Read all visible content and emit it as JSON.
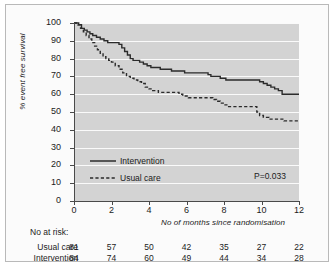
{
  "chart_data": {
    "type": "line",
    "title": "",
    "xlabel": "No of months since randomisation",
    "ylabel": "% event free survival",
    "xlim": [
      0,
      12
    ],
    "ylim": [
      0,
      100
    ],
    "xticks": [
      0,
      2,
      4,
      6,
      8,
      10,
      12
    ],
    "yticks": [
      0,
      10,
      20,
      30,
      40,
      50,
      60,
      70,
      80,
      90,
      100
    ],
    "grid": true,
    "legend_position": "center-left",
    "annotations": [
      {
        "text": "P=0.033",
        "x": 10.5,
        "y": 17
      }
    ],
    "series": [
      {
        "name": "Intervention",
        "style": "solid",
        "color": "#2b2b2b",
        "points": [
          [
            0.0,
            100
          ],
          [
            0.25,
            99
          ],
          [
            0.4,
            97
          ],
          [
            0.55,
            96
          ],
          [
            0.7,
            95
          ],
          [
            0.85,
            94
          ],
          [
            1.0,
            93
          ],
          [
            1.2,
            92
          ],
          [
            1.4,
            91
          ],
          [
            1.6,
            90
          ],
          [
            1.8,
            89
          ],
          [
            2.0,
            89
          ],
          [
            2.2,
            89
          ],
          [
            2.4,
            88
          ],
          [
            2.55,
            86
          ],
          [
            2.7,
            84
          ],
          [
            2.85,
            82
          ],
          [
            3.0,
            80
          ],
          [
            3.15,
            79
          ],
          [
            3.3,
            79
          ],
          [
            3.5,
            78
          ],
          [
            3.7,
            77
          ],
          [
            3.9,
            76
          ],
          [
            4.1,
            75
          ],
          [
            4.35,
            75
          ],
          [
            4.6,
            74
          ],
          [
            4.9,
            74
          ],
          [
            5.2,
            73
          ],
          [
            5.5,
            73
          ],
          [
            5.9,
            72
          ],
          [
            6.3,
            72
          ],
          [
            6.7,
            72
          ],
          [
            7.0,
            72
          ],
          [
            7.15,
            71
          ],
          [
            7.3,
            70
          ],
          [
            7.5,
            70
          ],
          [
            7.8,
            69
          ],
          [
            8.1,
            68
          ],
          [
            8.5,
            68
          ],
          [
            9.0,
            68
          ],
          [
            9.5,
            68
          ],
          [
            9.9,
            67
          ],
          [
            10.1,
            66
          ],
          [
            10.3,
            65
          ],
          [
            10.5,
            64
          ],
          [
            10.7,
            63
          ],
          [
            10.9,
            62
          ],
          [
            11.1,
            60
          ],
          [
            11.5,
            60
          ],
          [
            12.0,
            60
          ]
        ]
      },
      {
        "name": "Usual care",
        "style": "dashed",
        "color": "#2b2b2b",
        "points": [
          [
            0.0,
            100
          ],
          [
            0.2,
            99
          ],
          [
            0.35,
            97
          ],
          [
            0.5,
            95
          ],
          [
            0.65,
            93
          ],
          [
            0.8,
            91
          ],
          [
            0.95,
            89
          ],
          [
            1.1,
            87
          ],
          [
            1.25,
            85
          ],
          [
            1.4,
            83
          ],
          [
            1.55,
            81
          ],
          [
            1.7,
            80
          ],
          [
            1.85,
            79
          ],
          [
            2.0,
            78
          ],
          [
            2.2,
            76
          ],
          [
            2.4,
            74
          ],
          [
            2.6,
            72
          ],
          [
            2.8,
            70
          ],
          [
            3.0,
            69
          ],
          [
            3.2,
            68
          ],
          [
            3.4,
            67
          ],
          [
            3.6,
            66
          ],
          [
            3.8,
            64
          ],
          [
            4.0,
            63
          ],
          [
            4.2,
            62
          ],
          [
            4.5,
            61
          ],
          [
            4.8,
            61
          ],
          [
            5.1,
            61
          ],
          [
            5.4,
            61
          ],
          [
            5.6,
            60
          ],
          [
            5.8,
            59
          ],
          [
            6.1,
            58
          ],
          [
            6.5,
            58
          ],
          [
            6.9,
            58
          ],
          [
            7.2,
            58
          ],
          [
            7.4,
            57
          ],
          [
            7.6,
            56
          ],
          [
            7.8,
            55
          ],
          [
            8.0,
            54
          ],
          [
            8.2,
            53
          ],
          [
            8.5,
            53
          ],
          [
            9.0,
            53
          ],
          [
            9.4,
            53
          ],
          [
            9.6,
            53
          ],
          [
            9.75,
            50
          ],
          [
            9.9,
            48
          ],
          [
            10.1,
            47
          ],
          [
            10.4,
            46
          ],
          [
            10.8,
            46
          ],
          [
            11.2,
            45
          ],
          [
            11.6,
            45
          ],
          [
            12.0,
            45
          ]
        ]
      }
    ]
  },
  "legend": {
    "items": [
      {
        "label": "Intervention",
        "style": "solid"
      },
      {
        "label": "Usual care",
        "style": "dashed"
      }
    ]
  },
  "pvalue": "P=0.033",
  "risk_table": {
    "title": "No at risk:",
    "columns": [
      0,
      2,
      4,
      6,
      8,
      10,
      12
    ],
    "rows": [
      {
        "label": "Usual care",
        "values": [
          81,
          57,
          50,
          42,
          35,
          27,
          22
        ]
      },
      {
        "label": "Intervention",
        "values": [
          84,
          74,
          60,
          49,
          44,
          34,
          28
        ]
      }
    ]
  }
}
